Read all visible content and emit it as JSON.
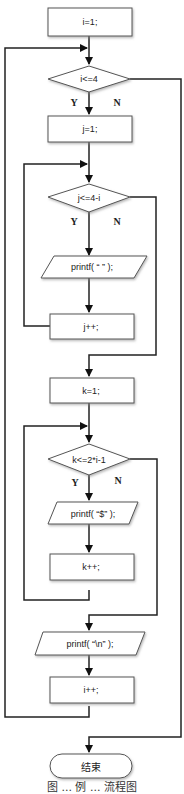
{
  "flowchart": {
    "nodes": {
      "init_i": {
        "type": "process",
        "label": "i=1;"
      },
      "cond_i": {
        "type": "decision",
        "label": "i<=4"
      },
      "init_j": {
        "type": "process",
        "label": "j=1;"
      },
      "cond_j": {
        "type": "decision",
        "label": "j<=4-i"
      },
      "print_space": {
        "type": "io",
        "label": "printf( “ ” );"
      },
      "inc_j": {
        "type": "process",
        "label": "j++;"
      },
      "init_k": {
        "type": "process",
        "label": "k=1;"
      },
      "cond_k": {
        "type": "decision",
        "label": "k<=2*i-1"
      },
      "print_dollar": {
        "type": "io",
        "label": "printf( “$” );"
      },
      "inc_k": {
        "type": "process",
        "label": "k++;"
      },
      "print_newline": {
        "type": "io",
        "label": "printf( “\\n” );"
      },
      "inc_i": {
        "type": "process",
        "label": "i++;"
      },
      "end": {
        "type": "terminator",
        "label": "结束"
      }
    },
    "branch_labels": {
      "yes": "Y",
      "no": "N"
    },
    "caption": "图 ...  例 ... 流程图"
  }
}
